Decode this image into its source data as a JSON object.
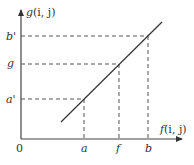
{
  "diagram": {
    "type": "linear-mapping",
    "y_axis": {
      "label_func": "g",
      "label_args": "(i, j)"
    },
    "x_axis": {
      "label_func": "f",
      "label_args": "(i, j)"
    },
    "origin_label": "0",
    "x_ticks": [
      {
        "label": "a",
        "x": 84
      },
      {
        "label": "f",
        "x": 119
      },
      {
        "label": "b",
        "x": 148
      }
    ],
    "y_ticks": [
      {
        "label": "b'",
        "y": 36
      },
      {
        "label": "g",
        "y": 64
      },
      {
        "label": "a'",
        "y": 99
      }
    ],
    "colors": {
      "axis": "#444444",
      "line": "#333333",
      "dash": "#555555",
      "text": "#333333"
    }
  }
}
